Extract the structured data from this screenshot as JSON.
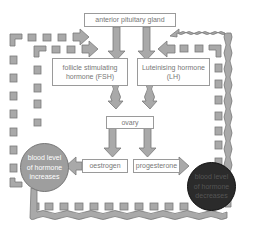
{
  "diagram": {
    "nodes": {
      "pituitary": "anterior pituitary gland",
      "fsh_line1": "follicle stimulating",
      "fsh_line2": "hormone (FSH)",
      "lh_line1": "Luteinising hormone",
      "lh_line2": "(LH)",
      "ovary": "ovary",
      "oestrogen": "oestrogen",
      "progesterone": "progesterone",
      "increase_line1": "blood level",
      "increase_line2": "of hormone",
      "increase_line3": "increases",
      "decrease_line1": "blood level",
      "decrease_line2": "of hormone",
      "decrease_line3": "decreases"
    },
    "colors": {
      "arrow_fill": "#a9a9a9",
      "arrow_stroke": "#7a7a7a",
      "box_border": "#9a9a9a",
      "increase_circle": "#9e9e9e",
      "decrease_circle": "#2b2b2b",
      "text": "#777777"
    }
  }
}
